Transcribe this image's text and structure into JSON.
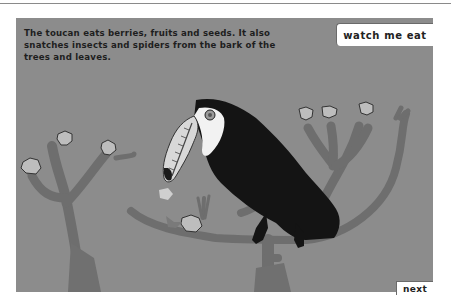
{
  "caption": {
    "line1": "The toucan eats berries, fruits and seeds. It also",
    "line2": "snatches insects and spiders from the bark of the",
    "line3": "trees and leaves."
  },
  "buttons": {
    "watch": "watch me eat",
    "next": "next"
  },
  "colors": {
    "background": "#8c8c8c",
    "branch": "#6e6e6e",
    "toucan_body": "#141414",
    "toucan_bib": "#f2f2f2",
    "beak": "#d8d8d8",
    "berry": "#bdbdbd"
  }
}
